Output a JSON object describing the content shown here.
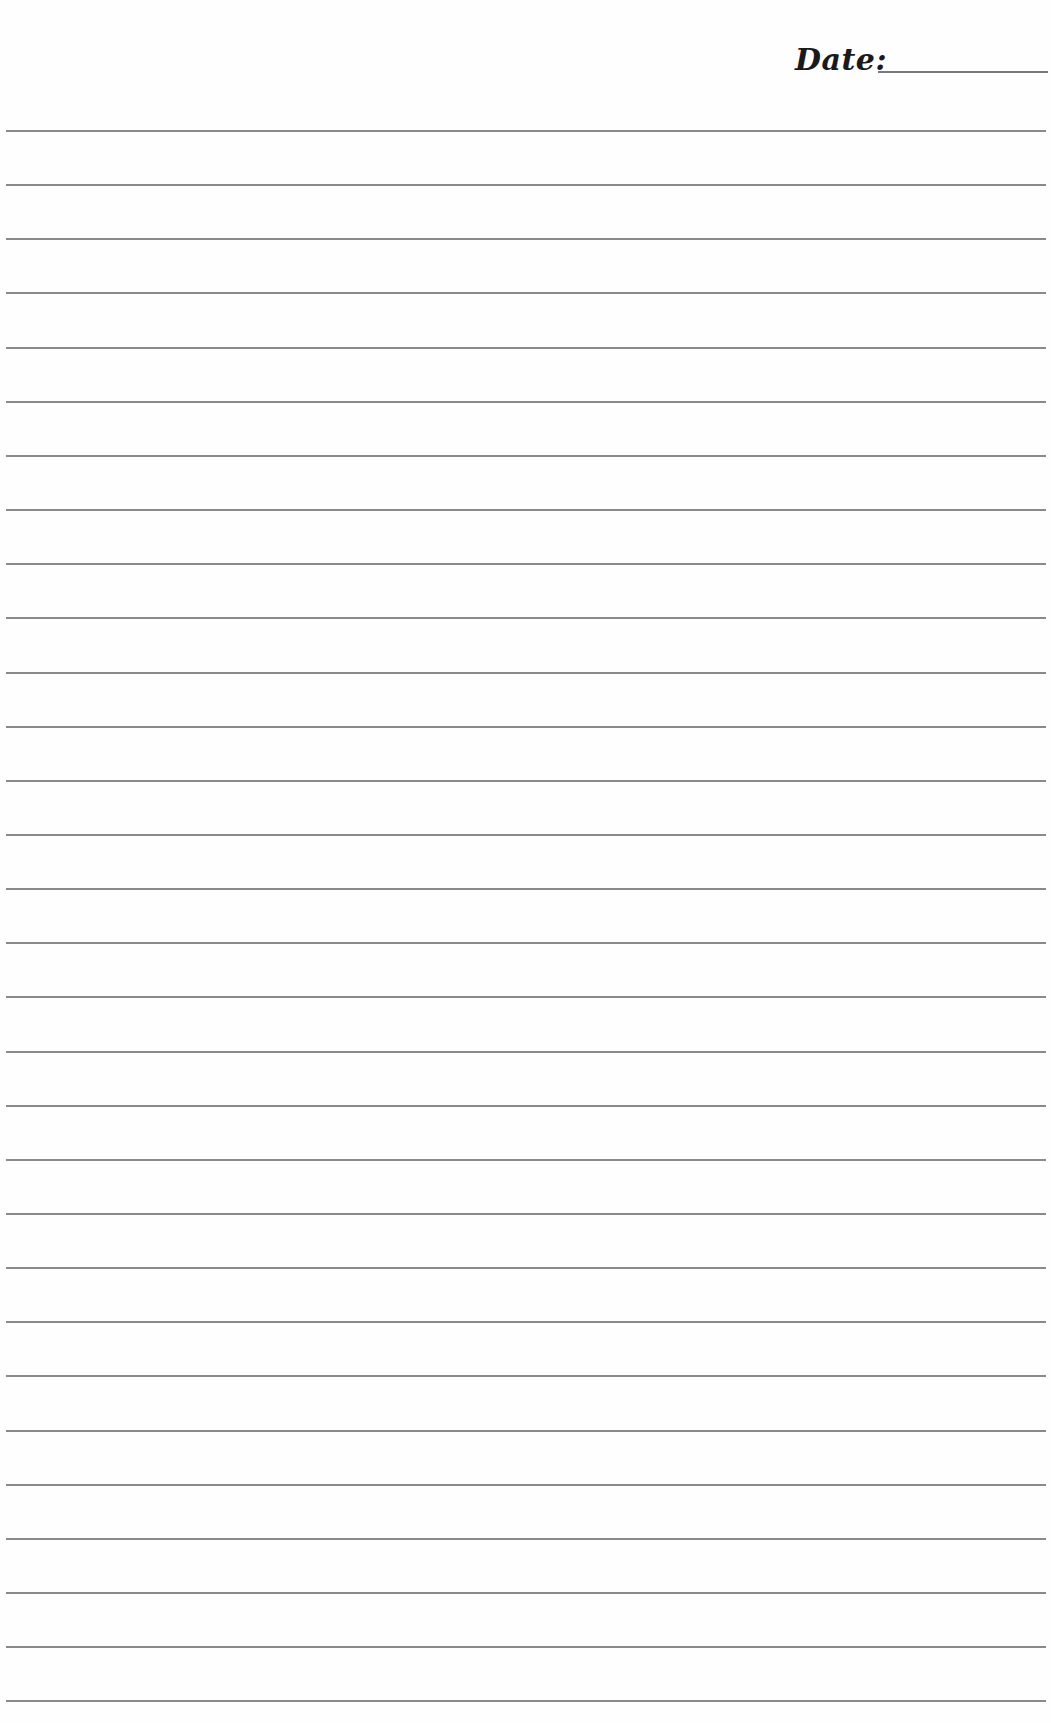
{
  "header": {
    "date_label": "Date:",
    "date_value": ""
  },
  "ruled_lines": {
    "count": 30,
    "first_y": 130,
    "spacing": 54.15,
    "color": "#8a8a8a"
  }
}
